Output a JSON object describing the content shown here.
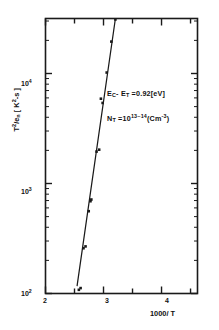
{
  "chart_data": {
    "type": "scatter",
    "title": "",
    "xlabel": "1000/T",
    "ylabel": "T2/en [K2-s]",
    "ylabel_display": "T²/eₙ  [ K²-s ]",
    "xscale": "linear",
    "yscale": "log",
    "xlim": [
      2,
      4.62
    ],
    "ylim": [
      100,
      31623
    ],
    "grid": false,
    "legend": null,
    "xticks": [
      2,
      2.5,
      3,
      3.5,
      4,
      4.5
    ],
    "xtick_labels": [
      "2",
      "",
      "3",
      "",
      "4",
      ""
    ],
    "ytick_labels": [
      "10²",
      "10³",
      "10⁴"
    ],
    "ytick_values": [
      100,
      1000,
      10000
    ],
    "points": [
      {
        "x": 2.575,
        "y": 108
      },
      {
        "x": 2.605,
        "y": 112
      },
      {
        "x": 2.655,
        "y": 258
      },
      {
        "x": 2.69,
        "y": 268
      },
      {
        "x": 2.745,
        "y": 560
      },
      {
        "x": 2.775,
        "y": 690
      },
      {
        "x": 2.79,
        "y": 715
      },
      {
        "x": 2.88,
        "y": 1950
      },
      {
        "x": 2.925,
        "y": 2030
      },
      {
        "x": 2.985,
        "y": 5400
      },
      {
        "x": 2.955,
        "y": 5900
      },
      {
        "x": 3.055,
        "y": 10200
      },
      {
        "x": 3.135,
        "y": 19500
      },
      {
        "x": 3.205,
        "y": 31000
      }
    ],
    "fit_line": {
      "x_start": 2.545,
      "y_start": 118,
      "x_end": 3.205,
      "y_end": 31600
    },
    "annotations": [
      {
        "id": "energy",
        "text": "E_C - E_T = 0.92[eV]",
        "html": "E<sub>C</sub>- E<sub>T</sub> =0.92[eV]"
      },
      {
        "id": "density",
        "text": "N_T = 10^13~14 (Cm^-3)",
        "html": "N<sub>T</sub> =10<sup>13~14</sup>(Cm<sup>-3</sup>)"
      }
    ]
  },
  "axes": {
    "x_title_html": "1000/ T",
    "y_title_html": "T<sup>2</sup>/e<sub>n</sub>  [ K<sup>2</sup>-s ]",
    "x_tick_2": "2",
    "x_tick_3": "3",
    "x_tick_4": "4",
    "y_tick_2": "10",
    "y_tick_2_exp": "2",
    "y_tick_3": "10",
    "y_tick_3_exp": "3",
    "y_tick_4": "10",
    "y_tick_4_exp": "4"
  },
  "style": {
    "frame_color": "#1a1a1a",
    "point_color": "#1a1a1a",
    "line_color": "#1a1a1a",
    "background": "#ffffff"
  }
}
